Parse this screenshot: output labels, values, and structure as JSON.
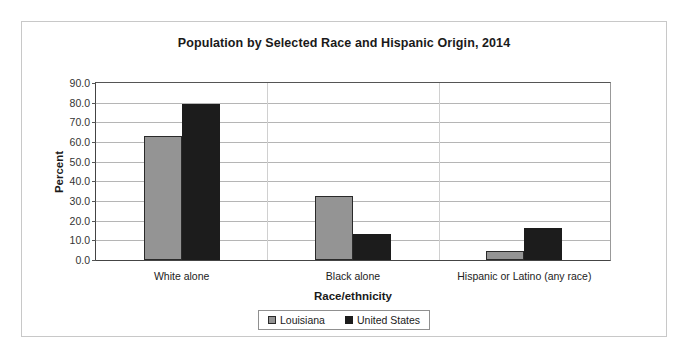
{
  "chart_data": {
    "type": "bar",
    "title": "Population by Selected Race and Hispanic Origin, 2014",
    "xlabel": "Race/ethnicity",
    "ylabel": "Percent",
    "categories": [
      "White alone",
      "Black alone",
      "Hispanic or Latino (any race)"
    ],
    "series": [
      {
        "name": "Louisiana",
        "color": "#949494",
        "values": [
          63.0,
          32.5,
          4.8
        ]
      },
      {
        "name": "United States",
        "color": "#1c1c1c",
        "values": [
          79.5,
          13.0,
          16.5
        ]
      }
    ],
    "ylim": [
      0.0,
      90.0
    ],
    "ytick_step": 10.0,
    "ytick_labels": [
      "0.0",
      "10.0",
      "20.0",
      "30.0",
      "40.0",
      "50.0",
      "60.0",
      "70.0",
      "80.0",
      "90.0"
    ],
    "grid": true,
    "legend_position": "bottom"
  }
}
